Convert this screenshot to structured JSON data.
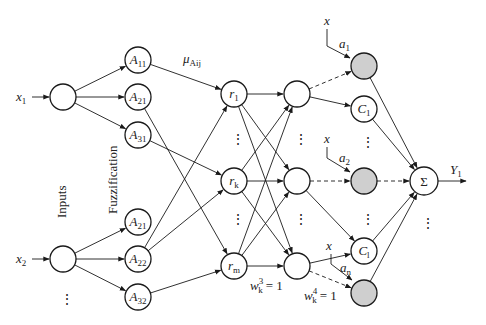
{
  "diagram": {
    "type": "ANFIS-style fuzzy neural network",
    "layer_labels": {
      "inputs": "Inputs",
      "fuzzification": "Fuzzification"
    },
    "inputs": [
      {
        "id": "x1",
        "label": "x",
        "sub": "1"
      },
      {
        "id": "x2",
        "label": "x",
        "sub": "2"
      }
    ],
    "membership_nodes": [
      {
        "id": "A11",
        "label": "A",
        "sub": "11",
        "input": "x1"
      },
      {
        "id": "A21a",
        "label": "A",
        "sub": "21",
        "input": "x1"
      },
      {
        "id": "A31",
        "label": "A",
        "sub": "31",
        "input": "x1"
      },
      {
        "id": "A21b",
        "label": "A",
        "sub": "21",
        "input": "x2"
      },
      {
        "id": "A22",
        "label": "A",
        "sub": "22",
        "input": "x2"
      },
      {
        "id": "A32",
        "label": "A",
        "sub": "32",
        "input": "x2"
      }
    ],
    "membership_edge_label": {
      "label": "μ",
      "sub": "Aij"
    },
    "rule_nodes": [
      {
        "id": "r1",
        "label": "r",
        "sub": "1"
      },
      {
        "id": "rk",
        "label": "r",
        "sub": "k"
      },
      {
        "id": "rm",
        "label": "r",
        "sub": "m"
      }
    ],
    "normalization_nodes": [
      {
        "id": "n1"
      },
      {
        "id": "nk"
      },
      {
        "id": "nm"
      }
    ],
    "weight_labels": {
      "w3": {
        "base": "w",
        "sup": "3",
        "sub": "k",
        "value": "= 1"
      },
      "w4": {
        "base": "w",
        "sup": "4",
        "sub": "k",
        "value": "= 1"
      }
    },
    "consequent_nodes": [
      {
        "id": "g1",
        "type": "gray",
        "input_label": "x",
        "param": "a",
        "param_sub": "1"
      },
      {
        "id": "C1",
        "type": "circle",
        "label": "C",
        "sub": "1"
      },
      {
        "id": "g2",
        "type": "gray",
        "input_label": "x",
        "param": "a",
        "param_sub": "2"
      },
      {
        "id": "Cl",
        "type": "circle",
        "label": "C",
        "sub": "l"
      },
      {
        "id": "gn",
        "type": "gray",
        "input_label": "x",
        "param": "a",
        "param_sub": "n"
      }
    ],
    "output_node": {
      "symbol": "Σ",
      "output": "Y",
      "output_sub": "1"
    },
    "ellipsis": "⋮",
    "edges": [
      [
        "x1",
        "A11"
      ],
      [
        "x1",
        "A21a"
      ],
      [
        "x1",
        "A31"
      ],
      [
        "x2",
        "A21b"
      ],
      [
        "x2",
        "A22"
      ],
      [
        "x2",
        "A32"
      ],
      [
        "A11",
        "r1"
      ],
      [
        "A21a",
        "rm"
      ],
      [
        "A31",
        "rk"
      ],
      [
        "A22",
        "r1"
      ],
      [
        "A22",
        "rk"
      ],
      [
        "A32",
        "rm"
      ],
      [
        "r1",
        "n1"
      ],
      [
        "r1",
        "nk"
      ],
      [
        "r1",
        "nm"
      ],
      [
        "rk",
        "n1"
      ],
      [
        "rk",
        "nk"
      ],
      [
        "rk",
        "nm"
      ],
      [
        "rm",
        "n1"
      ],
      [
        "rm",
        "nk"
      ],
      [
        "rm",
        "nm"
      ],
      [
        "n1",
        "g1",
        "dashed"
      ],
      [
        "n1",
        "C1"
      ],
      [
        "nk",
        "g2",
        "dashed"
      ],
      [
        "nk",
        "Cl"
      ],
      [
        "nm",
        "Cl"
      ],
      [
        "nm",
        "gn",
        "dashed"
      ],
      [
        "g1",
        "sum"
      ],
      [
        "C1",
        "sum"
      ],
      [
        "g2",
        "sum",
        "dashed"
      ],
      [
        "Cl",
        "sum"
      ],
      [
        "gn",
        "sum"
      ]
    ]
  }
}
